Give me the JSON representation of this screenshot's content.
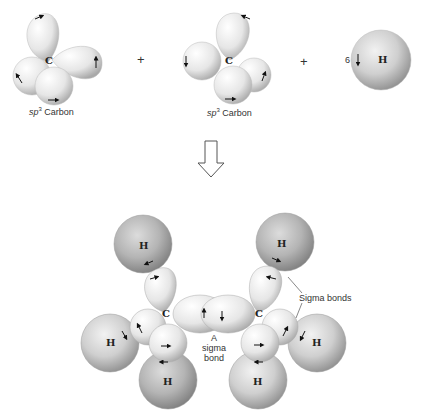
{
  "top_row": {
    "carbon1": {
      "atom": "C",
      "caption_italic": "sp",
      "caption_sup": "3",
      "caption_rest": " Carbon"
    },
    "plus1": "+",
    "carbon2": {
      "atom": "C",
      "caption_italic": "sp",
      "caption_sup": "3",
      "caption_rest": " Carbon"
    },
    "plus2": "+",
    "hydrogen": {
      "count": "6",
      "atom": "H"
    }
  },
  "arrow": {
    "icon": "hollow-down-arrow-icon"
  },
  "molecule": {
    "carbons": [
      "C",
      "C"
    ],
    "hydrogens": [
      "H",
      "H",
      "H",
      "H",
      "H",
      "H"
    ],
    "sigma_bond_label": [
      "A",
      "sigma",
      "bond"
    ],
    "sigma_bonds_label": "Sigma bonds"
  }
}
